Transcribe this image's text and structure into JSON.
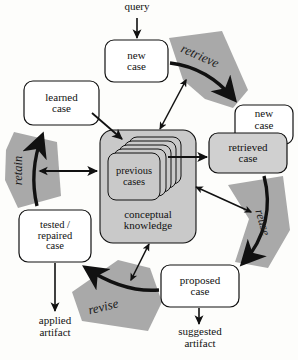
{
  "diagram": {
    "type": "process-cycle-diagram",
    "colors": {
      "wedge_gray": "#a9a9a9",
      "container_gray": "#c9c9c9",
      "box_gray": "#d0d0d0",
      "box_white": "#ffffff",
      "stroke": "#111111",
      "background": "#fdfdfb"
    }
  },
  "io_labels": {
    "query": "query",
    "applied_artifact": "applied\nartifact",
    "suggested_artifact": "suggested\nartifact"
  },
  "process_steps": [
    {
      "id": "retrieve",
      "label": "retrieve",
      "rotation_deg": -22
    },
    {
      "id": "reuse",
      "label": "reuse",
      "rotation_deg": 70
    },
    {
      "id": "revise",
      "label": "revise",
      "rotation_deg": -20
    },
    {
      "id": "retain",
      "label": "retain",
      "rotation_deg": -90
    }
  ],
  "case_boxes": [
    {
      "id": "new-case-top",
      "line1": "new",
      "line2": "case",
      "line3": "",
      "fill": "white"
    },
    {
      "id": "new-case-right",
      "line1": "new",
      "line2": "case",
      "line3": "",
      "fill": "white"
    },
    {
      "id": "retrieved-case",
      "line1": "retrieved",
      "line2": "case",
      "line3": "",
      "fill": "gray"
    },
    {
      "id": "proposed-case",
      "line1": "proposed",
      "line2": "case",
      "line3": "",
      "fill": "white"
    },
    {
      "id": "tested-repaired-case",
      "line1": "tested /",
      "line2": "repaired",
      "line3": "case",
      "fill": "white"
    },
    {
      "id": "learned-case",
      "line1": "learned",
      "line2": "case",
      "line3": "",
      "fill": "white"
    }
  ],
  "knowledge": {
    "container_line1": "conceptual",
    "container_line2": "knowledge",
    "cases_line1": "previous",
    "cases_line2": "cases",
    "stack_count": 5
  }
}
